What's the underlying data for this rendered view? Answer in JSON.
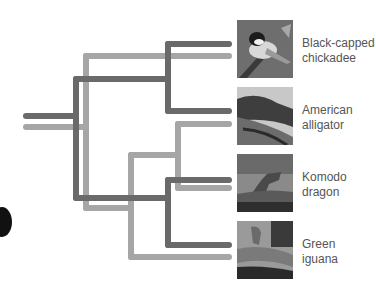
{
  "colors": {
    "dark_tree": "#6a6a6a",
    "light_tree": "#a6a6a6",
    "label": "#555555"
  },
  "taxa": [
    {
      "name_line1": "Black-capped",
      "name_line2": "chickadee",
      "photo": "bird-photo"
    },
    {
      "name_line1": "American",
      "name_line2": "alligator",
      "photo": "alligator-photo"
    },
    {
      "name_line1": "Komodo",
      "name_line2": "dragon",
      "photo": "komodo-photo"
    },
    {
      "name_line1": "Green",
      "name_line2": "iguana",
      "photo": "iguana-photo"
    }
  ]
}
